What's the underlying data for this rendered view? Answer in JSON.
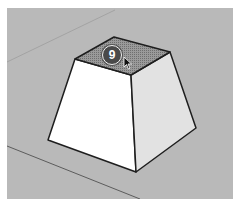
{
  "viewport": {
    "background": "#b9b9b9",
    "step_badge": {
      "label": "9",
      "color": "#4a4a4a"
    },
    "cursor": "arrow-cursor-icon"
  },
  "model": {
    "shape": "truncated pyramid",
    "top_face_state": "selected",
    "colors": {
      "top_face_selected": "#8a8a8a",
      "front_face": "#ffffff",
      "right_face": "#e2e2e2",
      "edges": "#1e1e1e"
    }
  }
}
